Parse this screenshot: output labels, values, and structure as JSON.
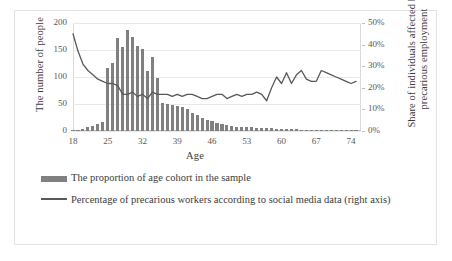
{
  "chart_data": {
    "type": "bar",
    "title": "",
    "xlabel": "Age",
    "ylabel": "The number of people",
    "y2label": "Share of individuals affected by precarious employment",
    "xlim": [
      18,
      76
    ],
    "ylim": [
      0,
      200
    ],
    "y2lim": [
      0,
      0.5
    ],
    "grid": true,
    "legend_position": "bottom-left",
    "y_ticks": [
      "0",
      "50",
      "100",
      "150",
      "200"
    ],
    "y_tick_values": [
      0,
      50,
      100,
      150,
      200
    ],
    "y2_ticks": [
      "0%",
      "10%",
      "20%",
      "30%",
      "40%",
      "50%"
    ],
    "y2_tick_values": [
      0,
      10,
      20,
      30,
      40,
      50
    ],
    "x_ticks": [
      "18",
      "25",
      "32",
      "39",
      "46",
      "53",
      "60",
      "67",
      "74"
    ],
    "x_tick_values": [
      18,
      25,
      32,
      39,
      46,
      53,
      60,
      67,
      74
    ],
    "colors": {
      "bar": "#808080",
      "line": "#595959",
      "grid": "#e8e8e8",
      "axis": "#bfbfbf",
      "text": "#3b3b3b"
    },
    "x": [
      18,
      19,
      20,
      21,
      22,
      23,
      24,
      25,
      26,
      27,
      28,
      29,
      30,
      31,
      32,
      33,
      34,
      35,
      36,
      37,
      38,
      39,
      40,
      41,
      42,
      43,
      44,
      45,
      46,
      47,
      48,
      49,
      50,
      51,
      52,
      53,
      54,
      55,
      56,
      57,
      58,
      59,
      60,
      61,
      62,
      63,
      64,
      65,
      66,
      67,
      68,
      69,
      70,
      71,
      72,
      73,
      74,
      75
    ],
    "series": [
      {
        "name": "The proportion of age cohort in the sample",
        "type": "bar",
        "axis": "left",
        "unit": "people",
        "values": [
          1,
          2,
          4,
          7,
          10,
          13,
          17,
          22,
          26,
          31,
          37,
          42,
          46,
          50,
          52,
          53,
          53,
          52,
          51,
          50,
          48,
          47,
          45,
          40,
          34,
          29,
          25,
          21,
          18,
          15,
          13,
          11,
          9,
          8,
          7,
          7,
          7,
          6,
          5,
          5,
          5,
          4,
          4,
          3,
          3,
          3,
          2,
          2,
          2,
          2,
          1,
          1,
          1,
          1,
          1,
          1,
          1,
          1
        ]
      },
      {
        "name": "Percentage of precarious workers according to social media data (right axis)",
        "type": "line",
        "axis": "right",
        "unit": "percent",
        "values": [
          45,
          37,
          31,
          28,
          26,
          24,
          23,
          22,
          22,
          21,
          17,
          17,
          18,
          16,
          17,
          15,
          18,
          17,
          17,
          17,
          16,
          17,
          16,
          17,
          17,
          16,
          15,
          15,
          16,
          17,
          17,
          15,
          16,
          17,
          16,
          17,
          17,
          18,
          17,
          14,
          20,
          25,
          22,
          27,
          22,
          26,
          28,
          24,
          23,
          23,
          28,
          27,
          26,
          25,
          24,
          23,
          22,
          23
        ]
      }
    ],
    "tall_bars": [
      {
        "x": 25,
        "v": 117
      },
      {
        "x": 27,
        "v": 172
      },
      {
        "x": 28,
        "v": 155
      },
      {
        "x": 29,
        "v": 187
      },
      {
        "x": 30,
        "v": 174
      },
      {
        "x": 31,
        "v": 157
      },
      {
        "x": 32,
        "v": 152
      },
      {
        "x": 26,
        "v": 126
      },
      {
        "x": 33,
        "v": 112
      },
      {
        "x": 34,
        "v": 137
      },
      {
        "x": 35,
        "v": 99
      }
    ]
  },
  "legend": {
    "items": [
      {
        "key": "bar",
        "label": "The proportion of age cohort in the sample"
      },
      {
        "key": "line",
        "label": "Percentage of precarious workers according to social media data (right axis)"
      }
    ]
  },
  "axis_titles": {
    "left": "The number of people",
    "right": "Share of individuals affected by precarious employment",
    "bottom": "Age"
  }
}
